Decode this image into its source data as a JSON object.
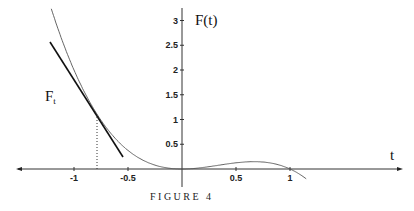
{
  "chart_data": {
    "type": "line",
    "title": "",
    "caption": "FIGURE 4",
    "xlabel": "t",
    "ylabel": "F(t)",
    "xlim": [
      -1.5,
      1.4
    ],
    "ylim": [
      0,
      3.2
    ],
    "x_ticks": [
      "-1",
      "-0.5",
      "0.5",
      "1"
    ],
    "y_ticks": [
      "0.5",
      "1",
      "1.5",
      "2",
      "2.5",
      "3"
    ],
    "series": [
      {
        "name": "F(t)",
        "function": "t^2(1-t)",
        "x": [
          -1.2,
          -1,
          -0.79,
          -0.5,
          0,
          0.5,
          0.67,
          1,
          1.15
        ],
        "y": [
          3.17,
          2.0,
          1.12,
          0.375,
          0,
          0.125,
          0.148,
          0,
          -0.15
        ]
      },
      {
        "name": "F_t",
        "description": "tangent line at t≈-0.79",
        "x": [
          -1.2,
          -0.53
        ],
        "y": [
          2.55,
          0.24
        ]
      }
    ],
    "annotations": [
      {
        "text": "F_t",
        "x": -1.25,
        "y": 1.4
      },
      {
        "text": "dotted vertical at t≈-0.79",
        "x": -0.79
      }
    ],
    "grid": false
  },
  "labels": {
    "ylabel": "F(t)",
    "xlabel": "t",
    "tangent": "F",
    "tangent_sub": "t",
    "caption": "FIGURE 4",
    "xt": [
      "-1",
      "-0.5",
      "0.5",
      "1"
    ],
    "yt": [
      "0.5",
      "1",
      "1.5",
      "2",
      "2.5",
      "3"
    ]
  }
}
